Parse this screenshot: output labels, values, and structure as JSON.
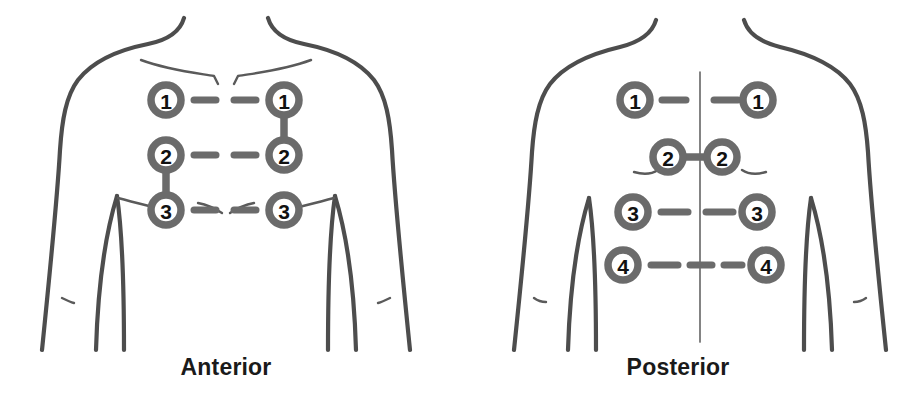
{
  "diagram": {
    "background_color": "#ffffff",
    "outline_color": "#4d4d4d",
    "pad_ring_color": "#6b6b6b",
    "pad_fill_color": "#ffffff",
    "label_color": "#111111",
    "lead_color": "#6b6b6b"
  },
  "views": [
    {
      "id": "anterior",
      "caption": "Anterior",
      "pad_count": 6,
      "row_count": 3,
      "pads": [
        {
          "label": "1",
          "side": "left",
          "row": 1,
          "cx": 166,
          "cy": 100,
          "r": 19
        },
        {
          "label": "1",
          "side": "right",
          "row": 1,
          "cx": 284,
          "cy": 100,
          "r": 19
        },
        {
          "label": "2",
          "side": "left",
          "row": 2,
          "cx": 166,
          "cy": 155,
          "r": 19
        },
        {
          "label": "2",
          "side": "right",
          "row": 2,
          "cx": 284,
          "cy": 155,
          "r": 19
        },
        {
          "label": "3",
          "side": "left",
          "row": 3,
          "cx": 166,
          "cy": 210,
          "r": 19
        },
        {
          "label": "3",
          "side": "right",
          "row": 3,
          "cx": 284,
          "cy": 210,
          "r": 19
        }
      ],
      "horizontal_leads": [
        {
          "row": 1,
          "dashes": 2
        },
        {
          "row": 2,
          "dashes": 2
        },
        {
          "row": 3,
          "dashes": 2
        }
      ],
      "vertical_leads": [
        {
          "from": "right-1",
          "to": "right-2"
        },
        {
          "from": "left-2",
          "to": "left-3"
        }
      ]
    },
    {
      "id": "posterior",
      "caption": "Posterior",
      "pad_count": 8,
      "row_count": 4,
      "has_spine_line": true,
      "pads": [
        {
          "label": "1",
          "side": "left",
          "row": 1,
          "cx": 635,
          "cy": 100,
          "r": 19
        },
        {
          "label": "1",
          "side": "right",
          "row": 1,
          "cx": 758,
          "cy": 100,
          "r": 19
        },
        {
          "label": "2",
          "side": "left",
          "row": 2,
          "cx": 668,
          "cy": 157,
          "r": 19
        },
        {
          "label": "2",
          "side": "right",
          "row": 2,
          "cx": 722,
          "cy": 157,
          "r": 19
        },
        {
          "label": "3",
          "side": "left",
          "row": 3,
          "cx": 633,
          "cy": 212,
          "r": 19
        },
        {
          "label": "3",
          "side": "right",
          "row": 3,
          "cx": 757,
          "cy": 212,
          "r": 19
        },
        {
          "label": "4",
          "side": "left",
          "row": 4,
          "cx": 623,
          "cy": 265,
          "r": 19
        },
        {
          "label": "4",
          "side": "right",
          "row": 4,
          "cx": 766,
          "cy": 265,
          "r": 19
        }
      ],
      "horizontal_leads": [
        {
          "row": 1,
          "dashes": 2
        },
        {
          "row": 2,
          "dashes": 1
        },
        {
          "row": 3,
          "dashes": 2
        },
        {
          "row": 4,
          "dashes": 3
        }
      ],
      "vertical_leads": []
    }
  ]
}
